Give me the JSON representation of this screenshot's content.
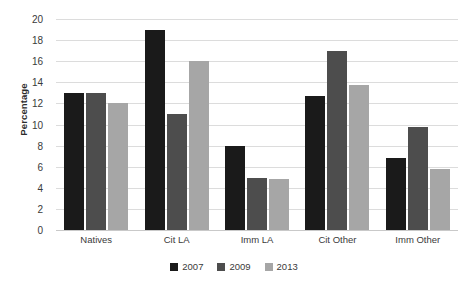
{
  "chart_data": {
    "type": "bar",
    "title": "",
    "xlabel": "",
    "ylabel": "Percentage",
    "categories": [
      "Natives",
      "Cit LA",
      "Imm LA",
      "Cit Other",
      "Imm Other"
    ],
    "series": [
      {
        "name": "2007",
        "color": "#1a1a1a",
        "values": [
          13.0,
          19.0,
          8.0,
          12.7,
          6.8
        ]
      },
      {
        "name": "2009",
        "color": "#4d4d4d",
        "values": [
          13.0,
          11.0,
          4.9,
          17.0,
          9.8
        ]
      },
      {
        "name": "2013",
        "color": "#a6a6a6",
        "values": [
          12.0,
          16.0,
          4.85,
          13.7,
          5.8
        ]
      }
    ],
    "ylim": [
      0,
      20
    ],
    "ytick_step": 2,
    "ytick_labels": [
      "0",
      "2",
      "4",
      "6",
      "8",
      "10",
      "12",
      "14",
      "16",
      "18",
      "20"
    ],
    "grid": "horizontal",
    "legend_position": "bottom-center",
    "gridline_color": "#dcdcdc",
    "background": "#ffffff"
  }
}
